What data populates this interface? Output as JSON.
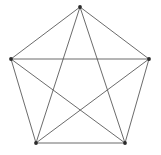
{
  "figure": {
    "background_color": "#ffffff",
    "width": 161,
    "height": 155
  },
  "style": {
    "edge_color": "#5a5a5a",
    "edge_width": 0.9,
    "vertex_color": "#2b2b2b",
    "vertex_radius": 1.9
  },
  "chart_data": {
    "type": "scatter",
    "xlabel": "",
    "ylabel": "",
    "xlim": [
      0,
      161
    ],
    "ylim": [
      0,
      155
    ],
    "grid": false,
    "legend": "none",
    "graph": {
      "name": "K5",
      "vertex_count": 5,
      "edge_count": 10,
      "vertices": [
        {
          "id": "top",
          "label": "",
          "x": 80,
          "y": 7
        },
        {
          "id": "right",
          "label": "",
          "x": 149,
          "y": 59
        },
        {
          "id": "bottom-right",
          "label": "",
          "x": 125,
          "y": 143
        },
        {
          "id": "bottom-left",
          "label": "",
          "x": 36,
          "y": 143
        },
        {
          "id": "left",
          "label": "",
          "x": 11,
          "y": 59
        }
      ],
      "edges": [
        {
          "id": "edge-top-right",
          "from": "top",
          "to": "right",
          "kind": "side"
        },
        {
          "id": "edge-right-bottomright",
          "from": "right",
          "to": "bottom-right",
          "kind": "side"
        },
        {
          "id": "edge-bottomright-bottomleft",
          "from": "bottom-right",
          "to": "bottom-left",
          "kind": "side"
        },
        {
          "id": "edge-bottomleft-left",
          "from": "bottom-left",
          "to": "left",
          "kind": "side"
        },
        {
          "id": "edge-left-top",
          "from": "left",
          "to": "top",
          "kind": "side"
        },
        {
          "id": "edge-top-bottomright",
          "from": "top",
          "to": "bottom-right",
          "kind": "diagonal"
        },
        {
          "id": "edge-top-bottomleft",
          "from": "top",
          "to": "bottom-left",
          "kind": "diagonal"
        },
        {
          "id": "edge-right-bottomleft",
          "from": "right",
          "to": "bottom-left",
          "kind": "diagonal"
        },
        {
          "id": "edge-right-left",
          "from": "right",
          "to": "left",
          "kind": "diagonal"
        },
        {
          "id": "edge-bottomright-left",
          "from": "bottom-right",
          "to": "left",
          "kind": "diagonal"
        }
      ]
    }
  }
}
